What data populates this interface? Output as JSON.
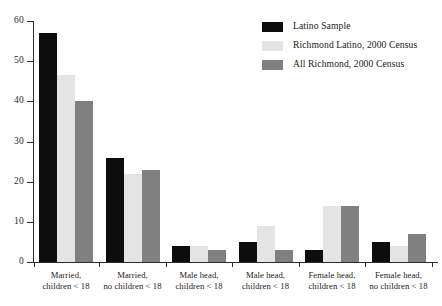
{
  "chart_data": {
    "type": "bar",
    "title": "",
    "subtitle": "",
    "xlabel": "",
    "ylabel": "",
    "ylim": [
      0,
      60
    ],
    "yticks": [
      0,
      10,
      20,
      30,
      40,
      50,
      60
    ],
    "ytick_labels": [
      "0",
      "10",
      "20",
      "30",
      "40",
      "50",
      "60"
    ],
    "grid": false,
    "legend_position": "top-right",
    "categories": [
      "Married, children < 18",
      "Married, no children < 18",
      "Male head, children < 18",
      "Male head, children < 18",
      "Female head, children < 18",
      "Female head, no children < 18"
    ],
    "category_lines": [
      [
        "Married,",
        "children < 18"
      ],
      [
        "Married,",
        "no children < 18"
      ],
      [
        "Male head,",
        "children < 18"
      ],
      [
        "Male head,",
        "children < 18"
      ],
      [
        "Female head,",
        "children < 18"
      ],
      [
        "Female head,",
        "no children < 18"
      ]
    ],
    "series": [
      {
        "name": "Latino Sample",
        "color": "#0d0d0d",
        "values": [
          57,
          26,
          4,
          5,
          3,
          5
        ]
      },
      {
        "name": "Richmond Latino, 2000 Census",
        "color": "#e4e4e4",
        "values": [
          46.5,
          22,
          4,
          9,
          14,
          4
        ]
      },
      {
        "name": "All Richmond, 2000 Census",
        "color": "#808080",
        "values": [
          40,
          23,
          3,
          3,
          14,
          7
        ]
      }
    ]
  },
  "axis": {
    "line_color": "#2b2b2b"
  }
}
